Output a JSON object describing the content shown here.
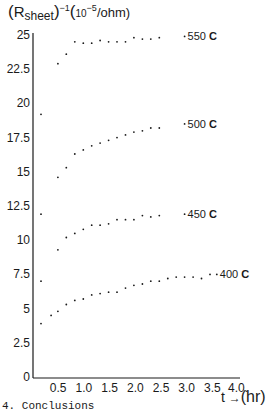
{
  "title": {
    "open_paren": "(",
    "r": "R",
    "sub": "sheet",
    "close_paren": ")",
    "exp": "−1",
    "unit_open": "(",
    "unit_base": "10",
    "unit_exp": "−5",
    "unit_rest": "/ohm)"
  },
  "xlabel": {
    "t": "t",
    "arrow": "→",
    "unit": "(hr)"
  },
  "footer": {
    "text": "4. Conclusions"
  },
  "chart_data": {
    "type": "scatter",
    "xlabel": "t → (hr)",
    "ylabel": "(R_sheet)^-1 (10^-5/ohm)",
    "xlim": [
      0,
      4.0
    ],
    "ylim": [
      0,
      25
    ],
    "grid": false,
    "legend_position": "inline-right",
    "x_ticks": [
      "0.5",
      "1.0",
      "1.5",
      "2.0",
      "2.5",
      "3.0",
      "3.5",
      "4.0."
    ],
    "x_tick_values": [
      0.5,
      1.0,
      1.5,
      2.0,
      2.5,
      3.0,
      3.5,
      4.0
    ],
    "y_ticks": [
      "0",
      "2.5",
      "5",
      "7.5",
      "10",
      "12.5",
      "15",
      "17.5",
      "20",
      "22.5",
      "25"
    ],
    "y_tick_values": [
      0,
      2.5,
      5,
      7.5,
      10,
      12.5,
      15,
      17.5,
      20,
      22.5,
      25
    ],
    "series": [
      {
        "name": "400 C",
        "label": "400",
        "label_suffix": "C",
        "points": [
          [
            0.1,
            7.0
          ],
          [
            0.1,
            3.9
          ],
          [
            0.3,
            4.5
          ],
          [
            0.5,
            4.8
          ],
          [
            0.75,
            5.3
          ],
          [
            1.0,
            5.6
          ],
          [
            1.25,
            5.7
          ],
          [
            1.5,
            6.0
          ],
          [
            1.75,
            6.1
          ],
          [
            2.0,
            6.2
          ],
          [
            2.25,
            6.2
          ],
          [
            2.5,
            6.5
          ],
          [
            2.75,
            6.7
          ],
          [
            3.0,
            6.8
          ],
          [
            3.25,
            7.0
          ],
          [
            3.5,
            7.0
          ],
          [
            3.75,
            7.2
          ],
          [
            4.0,
            7.3
          ],
          [
            4.25,
            7.3
          ],
          [
            4.5,
            7.3
          ],
          [
            4.75,
            7.2
          ],
          [
            5.0,
            7.5
          ],
          [
            5.2,
            7.5
          ]
        ]
      },
      {
        "name": "450 C",
        "label": "450",
        "label_suffix": "C",
        "points": [
          [
            0.1,
            11.9
          ],
          [
            0.5,
            9.3
          ],
          [
            0.75,
            10.2
          ],
          [
            1.0,
            10.5
          ],
          [
            1.25,
            10.8
          ],
          [
            1.5,
            11.1
          ],
          [
            1.75,
            11.1
          ],
          [
            2.0,
            11.2
          ],
          [
            2.25,
            11.5
          ],
          [
            2.5,
            11.5
          ],
          [
            2.75,
            11.5
          ],
          [
            3.0,
            11.8
          ],
          [
            3.25,
            11.7
          ],
          [
            3.5,
            11.8
          ],
          [
            4.25,
            11.9
          ]
        ]
      },
      {
        "name": "500 C",
        "label": "500",
        "label_suffix": "C",
        "points": [
          [
            0.1,
            19.2
          ],
          [
            0.5,
            14.6
          ],
          [
            0.75,
            15.3
          ],
          [
            1.0,
            16.3
          ],
          [
            1.25,
            16.6
          ],
          [
            1.5,
            16.9
          ],
          [
            1.75,
            17.1
          ],
          [
            2.0,
            17.3
          ],
          [
            2.25,
            17.5
          ],
          [
            2.5,
            17.7
          ],
          [
            2.75,
            17.9
          ],
          [
            3.0,
            18.0
          ],
          [
            3.25,
            18.2
          ],
          [
            3.5,
            18.2
          ],
          [
            4.25,
            18.5
          ]
        ]
      },
      {
        "name": "550 C",
        "label": "550",
        "label_suffix": "C",
        "points": [
          [
            0.5,
            22.9
          ],
          [
            0.75,
            23.6
          ],
          [
            1.0,
            24.5
          ],
          [
            1.25,
            24.4
          ],
          [
            1.5,
            24.4
          ],
          [
            1.75,
            24.6
          ],
          [
            2.0,
            24.5
          ],
          [
            2.25,
            24.5
          ],
          [
            2.5,
            24.5
          ],
          [
            2.75,
            24.8
          ],
          [
            3.0,
            24.7
          ],
          [
            3.25,
            24.7
          ],
          [
            3.5,
            24.8
          ],
          [
            4.25,
            24.9
          ]
        ]
      }
    ]
  }
}
